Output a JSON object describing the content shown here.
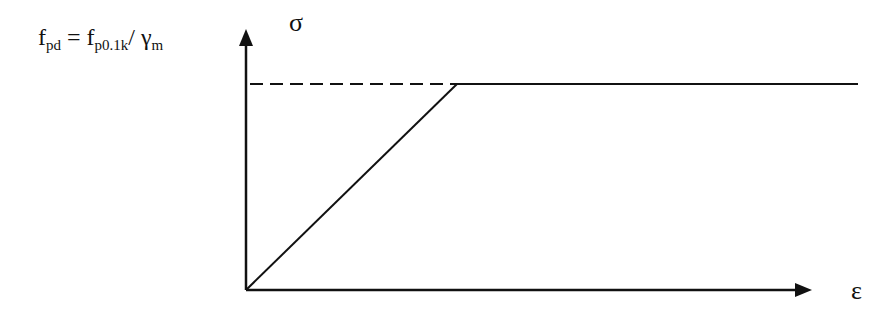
{
  "diagram": {
    "type": "stress-strain bilinear (elastic-perfectly plastic) design curve",
    "y_axis_label": "σ",
    "x_axis_label": "ε",
    "formula": {
      "lhs_main": "f",
      "lhs_sub": "pd",
      "equals": " = ",
      "rhs_main": "f",
      "rhs_sub": "p0.1k",
      "slash": "/ ",
      "gamma": "γ",
      "gamma_sub": "m"
    },
    "line_color": "#111111",
    "background": "#ffffff"
  }
}
